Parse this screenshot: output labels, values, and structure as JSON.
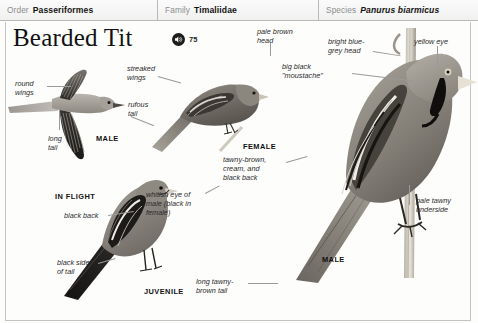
{
  "header": {
    "cells": [
      {
        "rank": "Order",
        "taxon": "Passeriformes",
        "italic": false
      },
      {
        "rank": "Family",
        "taxon": "Timaliidae",
        "italic": false
      },
      {
        "rank": "Species",
        "taxon": "Panurus biarmicus",
        "italic": true
      }
    ]
  },
  "title": {
    "name": "Bearded Tit",
    "sound_icon": "speaker-icon",
    "track_number": "75"
  },
  "annotations": {
    "round_wings": "round\nwings",
    "long_tail": "long\ntail",
    "streaked_wings": "streaked\nwings",
    "rufous_tail": "rufous\ntail",
    "pale_brown_head": "pale brown\nhead",
    "bright_blue_grey_head": "bright blue-\ngrey head",
    "big_black_moustache": "big black\n\"moustache\"",
    "yellow_eye": "yellow eye",
    "tawny_brown_back": "tawny-brown,\ncream, and\nblack back",
    "whitish_eye": "whitish eye of\nmale (black in\nfemale)",
    "pale_tawny_underside": "pale tawny\nunderside",
    "black_back": "black back",
    "black_sides_of_tail": "black sides\nof tail",
    "long_tawny_brown_tail": "long tawny-\nbrown tail"
  },
  "plate_labels": {
    "male_flight": "MALE",
    "in_flight": "IN FLIGHT",
    "female": "FEMALE",
    "juvenile": "JUVENILE",
    "male_perched": "MALE"
  },
  "colors": {
    "rule": "#c3c3c3",
    "leader": "#9a9a9a",
    "rank_text": "#8d8d8d",
    "body_text": "#1a1a1a",
    "header_bg": "#f1f1f0"
  }
}
